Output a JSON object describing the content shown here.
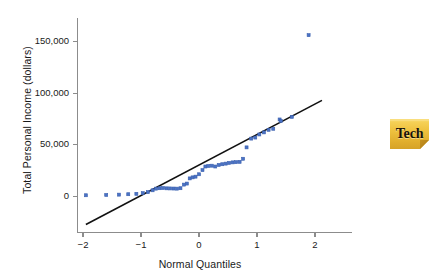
{
  "figure": {
    "tech_badge": {
      "label": "Tech",
      "icon": "sticky-note-icon",
      "colors": {
        "fill_top": "#f6cf4e",
        "fill_mid": "#e8b52f",
        "fill_bottom": "#d9a82a",
        "fold": "#c8921f",
        "text": "#17120a"
      }
    }
  },
  "chart_data": {
    "type": "scatter",
    "title": "",
    "subtitle": "",
    "xlabel": "Normal Quantiles",
    "ylabel": "Total Personal Income (dollars)",
    "xlim": [
      -2.35,
      2.45
    ],
    "ylim": [
      -30000,
      178000
    ],
    "grid": false,
    "legend": null,
    "legend_position": "none",
    "xticks": [
      -2,
      -1,
      0,
      1,
      2
    ],
    "xticklabels": [
      "−2",
      "−1",
      "0",
      "1",
      "2"
    ],
    "yticks": [
      0,
      50000,
      100000,
      150000
    ],
    "yticklabels": [
      "0",
      "50,000",
      "100,000",
      "150,000"
    ],
    "marker": {
      "shape": "square",
      "size_px": 3,
      "color": "#4a72c4",
      "edge_color": "#3a5fae"
    },
    "reference_line": {
      "name": "normal-reference-line",
      "color": "#111111",
      "width_px": 1.6,
      "x": [
        -1.95,
        2.12
      ],
      "y": [
        -27000,
        93000
      ],
      "slope": 29484,
      "intercept": 30494
    },
    "annotations": [
      {
        "name": "outlier-point",
        "x": 1.89,
        "y": 156000,
        "note": "high outlier far above reference line"
      }
    ],
    "points": [
      {
        "x": -1.95,
        "y": 1200
      },
      {
        "x": -1.6,
        "y": 1500
      },
      {
        "x": -1.38,
        "y": 1800
      },
      {
        "x": -1.22,
        "y": 2200
      },
      {
        "x": -1.08,
        "y": 2600
      },
      {
        "x": -0.97,
        "y": 3200
      },
      {
        "x": -0.88,
        "y": 4200
      },
      {
        "x": -0.8,
        "y": 6000
      },
      {
        "x": -0.74,
        "y": 7600
      },
      {
        "x": -0.68,
        "y": 8000
      },
      {
        "x": -0.62,
        "y": 8200
      },
      {
        "x": -0.56,
        "y": 7900
      },
      {
        "x": -0.5,
        "y": 7800
      },
      {
        "x": -0.44,
        "y": 7700
      },
      {
        "x": -0.38,
        "y": 7600
      },
      {
        "x": -0.32,
        "y": 8000
      },
      {
        "x": -0.26,
        "y": 11500
      },
      {
        "x": -0.21,
        "y": 12500
      },
      {
        "x": -0.16,
        "y": 17500
      },
      {
        "x": -0.11,
        "y": 18500
      },
      {
        "x": -0.06,
        "y": 19200
      },
      {
        "x": 0.0,
        "y": 21500
      },
      {
        "x": 0.06,
        "y": 25500
      },
      {
        "x": 0.11,
        "y": 29000
      },
      {
        "x": 0.16,
        "y": 29500
      },
      {
        "x": 0.22,
        "y": 29800
      },
      {
        "x": 0.28,
        "y": 29000
      },
      {
        "x": 0.34,
        "y": 30500
      },
      {
        "x": 0.4,
        "y": 31200
      },
      {
        "x": 0.46,
        "y": 31800
      },
      {
        "x": 0.52,
        "y": 32500
      },
      {
        "x": 0.58,
        "y": 33000
      },
      {
        "x": 0.64,
        "y": 33200
      },
      {
        "x": 0.7,
        "y": 33500
      },
      {
        "x": 0.76,
        "y": 36500
      },
      {
        "x": 0.82,
        "y": 47500
      },
      {
        "x": 0.9,
        "y": 56000
      },
      {
        "x": 0.97,
        "y": 57000
      },
      {
        "x": 1.04,
        "y": 60000
      },
      {
        "x": 1.12,
        "y": 62000
      },
      {
        "x": 1.2,
        "y": 64500
      },
      {
        "x": 1.28,
        "y": 65500
      },
      {
        "x": 1.39,
        "y": 74500
      },
      {
        "x": 1.41,
        "y": 73000
      },
      {
        "x": 1.6,
        "y": 77000
      },
      {
        "x": 1.89,
        "y": 156000
      }
    ]
  }
}
